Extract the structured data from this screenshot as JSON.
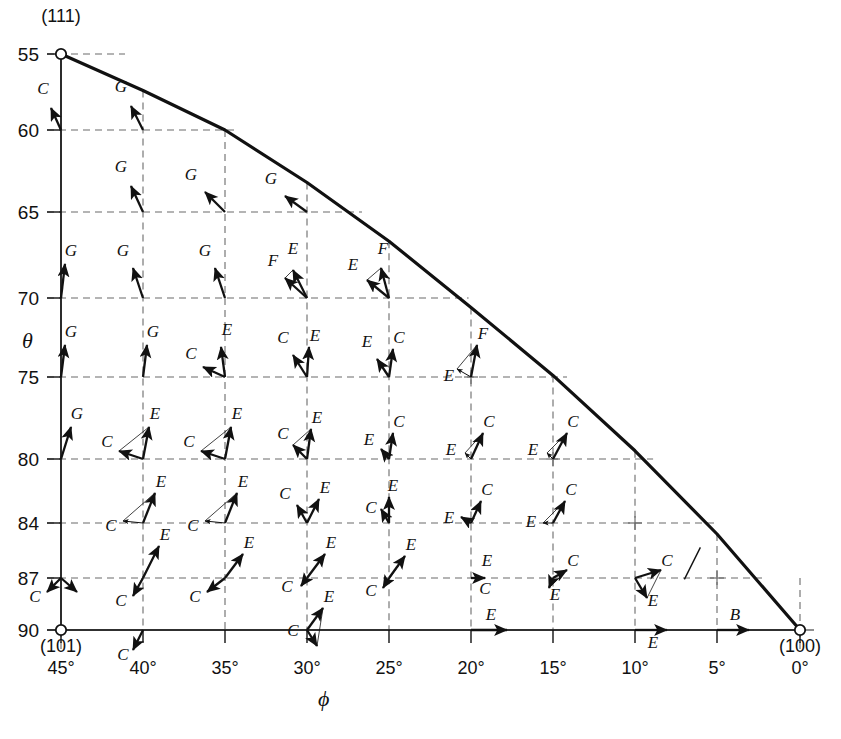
{
  "figure": {
    "title": "",
    "caption": "",
    "background": "#ffffff",
    "ink": "#111111",
    "grid_color": "#6b6b6b"
  },
  "axes": {
    "x_label": "ϕ",
    "y_label": "θ",
    "x_ticks": [
      "45°",
      "40°",
      "35°",
      "30°",
      "25°",
      "20°",
      "15°",
      "10°",
      "5°",
      "0°"
    ],
    "y_ticks": [
      "55",
      "60",
      "65",
      "70",
      "75",
      "80",
      "84",
      "87",
      "90"
    ]
  },
  "poles": {
    "p111": "(111)",
    "p101": "(101)",
    "p100": "(100)"
  },
  "chart_data": {
    "type": "scatter",
    "title": "",
    "xlabel": "ϕ",
    "ylabel": "θ",
    "x": [
      45,
      40,
      35,
      30,
      25,
      20,
      15,
      10,
      5,
      0
    ],
    "y": [
      55,
      60,
      65,
      70,
      75,
      80,
      84,
      87,
      90
    ],
    "xlim": [
      45,
      0
    ],
    "ylim": [
      55,
      90
    ],
    "grid": true,
    "legend": "none",
    "boundary_curve": {
      "name": "zone boundary (111)-(100)",
      "points": [
        [
          45,
          55
        ],
        [
          40,
          57.4
        ],
        [
          35,
          60.0
        ],
        [
          30,
          63.2
        ],
        [
          25,
          66.7
        ],
        [
          20,
          70.6
        ],
        [
          15,
          74.9
        ],
        [
          10,
          79.5
        ],
        [
          5,
          84.6
        ],
        [
          0,
          90
        ]
      ]
    },
    "markers": [
      {
        "label": "(111)",
        "phi": 45,
        "theta": 55,
        "shape": "open-circle"
      },
      {
        "label": "(101)",
        "phi": 45,
        "theta": 90,
        "shape": "open-circle"
      },
      {
        "label": "(100)",
        "phi": 0,
        "theta": 90,
        "shape": "open-circle"
      }
    ],
    "vector_labels": [
      "B",
      "C",
      "E",
      "F",
      "G"
    ],
    "vectors": [
      {
        "phi": 45,
        "theta": 60,
        "label": "C",
        "dx": -10,
        "dy": -22,
        "style": "solid",
        "lx": -18,
        "ly": -36
      },
      {
        "phi": 40,
        "theta": 60,
        "label": "G",
        "dx": -12,
        "dy": -24,
        "style": "solid",
        "lx": -22,
        "ly": -38
      },
      {
        "phi": 40,
        "theta": 65,
        "label": "G",
        "dx": -12,
        "dy": -26,
        "style": "solid",
        "lx": -22,
        "ly": -40
      },
      {
        "phi": 35,
        "theta": 65,
        "label": "G",
        "dx": -20,
        "dy": -20,
        "style": "solid",
        "lx": -34,
        "ly": -32
      },
      {
        "phi": 30,
        "theta": 65,
        "label": "G",
        "dx": -22,
        "dy": -16,
        "style": "solid",
        "lx": -36,
        "ly": -28
      },
      {
        "phi": 45,
        "theta": 70,
        "label": "G",
        "dx": 4,
        "dy": -34,
        "style": "solid",
        "lx": 10,
        "ly": -42
      },
      {
        "phi": 40,
        "theta": 70,
        "label": "G",
        "dx": -10,
        "dy": -30,
        "style": "solid",
        "lx": -20,
        "ly": -42
      },
      {
        "phi": 35,
        "theta": 70,
        "label": "G",
        "dx": -10,
        "dy": -30,
        "style": "solid",
        "lx": -20,
        "ly": -42
      },
      {
        "phi": 30,
        "theta": 70,
        "label": "E",
        "dx": -14,
        "dy": -28,
        "style": "solid",
        "lx": -14,
        "ly": -44
      },
      {
        "phi": 30,
        "theta": 70,
        "label": "F",
        "dx": -22,
        "dy": -20,
        "style": "solid",
        "lx": -34,
        "ly": -32
      },
      {
        "phi": 25,
        "theta": 70,
        "label": "F",
        "dx": -8,
        "dy": -30,
        "style": "solid",
        "lx": -6,
        "ly": -44
      },
      {
        "phi": 25,
        "theta": 70,
        "label": "E",
        "dx": -22,
        "dy": -18,
        "style": "solid",
        "lx": -36,
        "ly": -28
      },
      {
        "phi": 45,
        "theta": 75,
        "label": "G",
        "dx": 4,
        "dy": -32,
        "style": "solid",
        "lx": 10,
        "ly": -40
      },
      {
        "phi": 40,
        "theta": 75,
        "label": "G",
        "dx": 4,
        "dy": -32,
        "style": "solid",
        "lx": 10,
        "ly": -40
      },
      {
        "phi": 35,
        "theta": 75,
        "label": "E",
        "dx": -4,
        "dy": -30,
        "style": "solid",
        "lx": 2,
        "ly": -42
      },
      {
        "phi": 35,
        "theta": 75,
        "label": "C",
        "dx": -22,
        "dy": -10,
        "style": "solid",
        "lx": -34,
        "ly": -18
      },
      {
        "phi": 30,
        "theta": 75,
        "label": "E",
        "dx": 2,
        "dy": -30,
        "style": "solid",
        "lx": 8,
        "ly": -36
      },
      {
        "phi": 30,
        "theta": 75,
        "label": "C",
        "dx": -14,
        "dy": -22,
        "style": "solid",
        "lx": -24,
        "ly": -34
      },
      {
        "phi": 25,
        "theta": 75,
        "label": "C",
        "dx": 4,
        "dy": -28,
        "style": "solid",
        "lx": 10,
        "ly": -34
      },
      {
        "phi": 25,
        "theta": 75,
        "label": "E",
        "dx": -12,
        "dy": -18,
        "style": "solid",
        "lx": -22,
        "ly": -30
      },
      {
        "phi": 20,
        "theta": 75,
        "label": "F",
        "dx": 6,
        "dy": -32,
        "style": "solid",
        "lx": 12,
        "ly": -38
      },
      {
        "phi": 20,
        "theta": 75,
        "label": "E",
        "dx": -14,
        "dy": -8,
        "style": "thin",
        "lx": -22,
        "ly": 4
      },
      {
        "phi": 45,
        "theta": 80,
        "label": "G",
        "dx": 10,
        "dy": -32,
        "style": "solid",
        "lx": 16,
        "ly": -40
      },
      {
        "phi": 40,
        "theta": 80,
        "label": "E",
        "dx": 6,
        "dy": -32,
        "style": "solid",
        "lx": 12,
        "ly": -40
      },
      {
        "phi": 40,
        "theta": 80,
        "label": "C",
        "dx": -24,
        "dy": -8,
        "style": "solid",
        "lx": -36,
        "ly": -12
      },
      {
        "phi": 35,
        "theta": 80,
        "label": "E",
        "dx": 6,
        "dy": -32,
        "style": "solid",
        "lx": 12,
        "ly": -40
      },
      {
        "phi": 35,
        "theta": 80,
        "label": "C",
        "dx": -24,
        "dy": -8,
        "style": "solid",
        "lx": -36,
        "ly": -12
      },
      {
        "phi": 30,
        "theta": 80,
        "label": "E",
        "dx": 4,
        "dy": -30,
        "style": "solid",
        "lx": 10,
        "ly": -36
      },
      {
        "phi": 30,
        "theta": 80,
        "label": "C",
        "dx": -14,
        "dy": -14,
        "style": "solid",
        "lx": -24,
        "ly": -20
      },
      {
        "phi": 25,
        "theta": 80,
        "label": "C",
        "dx": 4,
        "dy": -26,
        "style": "solid",
        "lx": 10,
        "ly": -32
      },
      {
        "phi": 25,
        "theta": 80,
        "label": "E",
        "dx": -8,
        "dy": -10,
        "style": "solid",
        "lx": -20,
        "ly": -14
      },
      {
        "phi": 20,
        "theta": 80,
        "label": "C",
        "dx": 12,
        "dy": -26,
        "style": "solid",
        "lx": 18,
        "ly": -32
      },
      {
        "phi": 20,
        "theta": 80,
        "label": "E",
        "dx": -6,
        "dy": -6,
        "style": "thin",
        "lx": -20,
        "ly": -4
      },
      {
        "phi": 15,
        "theta": 80,
        "label": "C",
        "dx": 14,
        "dy": -26,
        "style": "solid",
        "lx": 20,
        "ly": -32
      },
      {
        "phi": 15,
        "theta": 80,
        "label": "E",
        "dx": -6,
        "dy": -6,
        "style": "thin",
        "lx": -20,
        "ly": -4
      },
      {
        "phi": 40,
        "theta": 84,
        "label": "E",
        "dx": 12,
        "dy": -30,
        "style": "solid",
        "lx": 18,
        "ly": -36
      },
      {
        "phi": 40,
        "theta": 84,
        "label": "C",
        "dx": -20,
        "dy": -2,
        "style": "thin",
        "lx": -32,
        "ly": 8
      },
      {
        "phi": 35,
        "theta": 84,
        "label": "E",
        "dx": 12,
        "dy": -30,
        "style": "solid",
        "lx": 18,
        "ly": -36
      },
      {
        "phi": 35,
        "theta": 84,
        "label": "C",
        "dx": -20,
        "dy": -2,
        "style": "thin",
        "lx": -32,
        "ly": 8
      },
      {
        "phi": 30,
        "theta": 84,
        "label": "E",
        "dx": 12,
        "dy": -24,
        "style": "solid",
        "lx": 18,
        "ly": -30
      },
      {
        "phi": 30,
        "theta": 84,
        "label": "C",
        "dx": -10,
        "dy": -18,
        "style": "solid",
        "lx": -22,
        "ly": -24
      },
      {
        "phi": 25,
        "theta": 84,
        "label": "E",
        "dx": 0,
        "dy": -26,
        "style": "solid",
        "lx": 4,
        "ly": -32
      },
      {
        "phi": 25,
        "theta": 84,
        "label": "C",
        "dx": -8,
        "dy": -14,
        "style": "solid",
        "lx": -18,
        "ly": -10
      },
      {
        "phi": 20,
        "theta": 84,
        "label": "C",
        "dx": 10,
        "dy": -22,
        "style": "solid",
        "lx": 16,
        "ly": -28
      },
      {
        "phi": 20,
        "theta": 84,
        "label": "E",
        "dx": -10,
        "dy": -6,
        "style": "solid",
        "lx": -22,
        "ly": 0
      },
      {
        "phi": 15,
        "theta": 84,
        "label": "C",
        "dx": 12,
        "dy": -22,
        "style": "solid",
        "lx": 18,
        "ly": -28
      },
      {
        "phi": 15,
        "theta": 84,
        "label": "E",
        "dx": -10,
        "dy": 0,
        "style": "thin",
        "lx": -22,
        "ly": 4
      },
      {
        "phi": 45,
        "theta": 87,
        "label": "C",
        "dx": -14,
        "dy": 14,
        "style": "solid",
        "lx": -26,
        "ly": 24
      },
      {
        "phi": 45,
        "theta": 87,
        "label": "",
        "dx": 16,
        "dy": 14,
        "style": "solid",
        "lx": 0,
        "ly": 0
      },
      {
        "phi": 40,
        "theta": 87,
        "label": "E",
        "dx": 16,
        "dy": -32,
        "style": "solid",
        "lx": 22,
        "ly": -38
      },
      {
        "phi": 40,
        "theta": 87,
        "label": "C",
        "dx": -10,
        "dy": 18,
        "style": "solid",
        "lx": -22,
        "ly": 28
      },
      {
        "phi": 35,
        "theta": 87,
        "label": "E",
        "dx": 18,
        "dy": -24,
        "style": "solid",
        "lx": 24,
        "ly": -30
      },
      {
        "phi": 35,
        "theta": 87,
        "label": "C",
        "dx": -18,
        "dy": 14,
        "style": "solid",
        "lx": -30,
        "ly": 24
      },
      {
        "phi": 30,
        "theta": 87,
        "label": "E",
        "dx": 18,
        "dy": -24,
        "style": "solid",
        "lx": 24,
        "ly": -30
      },
      {
        "phi": 30,
        "theta": 87,
        "label": "C",
        "dx": -6,
        "dy": 8,
        "style": "solid",
        "lx": -20,
        "ly": 14
      },
      {
        "phi": 25,
        "theta": 87,
        "label": "E",
        "dx": 16,
        "dy": -22,
        "style": "solid",
        "lx": 22,
        "ly": -28
      },
      {
        "phi": 25,
        "theta": 87,
        "label": "C",
        "dx": -6,
        "dy": 10,
        "style": "solid",
        "lx": -18,
        "ly": 18
      },
      {
        "phi": 20,
        "theta": 87,
        "label": "E",
        "dx": 14,
        "dy": 0,
        "style": "solid",
        "lx": 16,
        "ly": -12
      },
      {
        "phi": 20,
        "theta": 87,
        "label": "C",
        "dx": 0,
        "dy": 2,
        "style": "none",
        "lx": 14,
        "ly": 16
      },
      {
        "phi": 15,
        "theta": 87,
        "label": "C",
        "dx": 14,
        "dy": -8,
        "style": "solid",
        "lx": 20,
        "ly": -12
      },
      {
        "phi": 15,
        "theta": 87,
        "label": "E",
        "dx": -4,
        "dy": 10,
        "style": "solid",
        "lx": 2,
        "ly": 22
      },
      {
        "phi": 10,
        "theta": 87,
        "label": "C",
        "dx": 26,
        "dy": -8,
        "style": "solid",
        "lx": 32,
        "ly": -12
      },
      {
        "phi": 10,
        "theta": 87,
        "label": "E",
        "dx": 12,
        "dy": 20,
        "style": "solid",
        "lx": 18,
        "ly": 28
      },
      {
        "phi": 40,
        "theta": 90,
        "label": "C",
        "dx": -10,
        "dy": 20,
        "style": "solid",
        "lx": -20,
        "ly": 30
      },
      {
        "phi": 30,
        "theta": 90,
        "label": "E",
        "dx": 16,
        "dy": -22,
        "style": "solid",
        "lx": 22,
        "ly": -28
      },
      {
        "phi": 30,
        "theta": 90,
        "label": "C",
        "dx": 10,
        "dy": 16,
        "style": "solid",
        "lx": -14,
        "ly": 6
      },
      {
        "phi": 20,
        "theta": 90,
        "label": "E",
        "dx": 36,
        "dy": 0,
        "style": "solid",
        "lx": 20,
        "ly": -10
      },
      {
        "phi": 10,
        "theta": 90,
        "label": "E",
        "dx": 32,
        "dy": 0,
        "style": "solid",
        "lx": 18,
        "ly": 18
      },
      {
        "phi": 5,
        "theta": 90,
        "label": "B",
        "dx": 32,
        "dy": 0,
        "style": "solid",
        "lx": 18,
        "ly": -10
      }
    ]
  }
}
